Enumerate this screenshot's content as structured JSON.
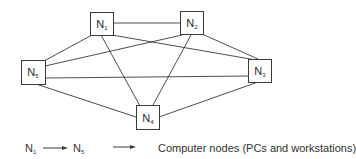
{
  "diagram": {
    "type": "network-topology",
    "line_color": "#3a3a3a",
    "box_fill": "#ffffff",
    "nodes": [
      {
        "id": "N1",
        "base": "N",
        "sub": "1",
        "x": 90,
        "y": 12
      },
      {
        "id": "N2",
        "base": "N",
        "sub": "2",
        "x": 180,
        "y": 12
      },
      {
        "id": "N3",
        "base": "N",
        "sub": "3",
        "x": 248,
        "y": 59
      },
      {
        "id": "N4",
        "base": "N",
        "sub": "4",
        "x": 136,
        "y": 105
      },
      {
        "id": "N5",
        "base": "N",
        "sub": "5",
        "x": 21,
        "y": 60
      }
    ],
    "edges": [
      [
        "N1",
        "N2"
      ],
      [
        "N1",
        "N5"
      ],
      [
        "N1",
        "N3"
      ],
      [
        "N1",
        "N4"
      ],
      [
        "N2",
        "N5"
      ],
      [
        "N2",
        "N3"
      ],
      [
        "N2",
        "N4"
      ],
      [
        "N5",
        "N3"
      ],
      [
        "N5",
        "N4"
      ],
      [
        "N3",
        "N4"
      ]
    ]
  },
  "legend": {
    "range_start": {
      "base": "N",
      "sub": "1"
    },
    "range_end": {
      "base": "N",
      "sub": "5"
    },
    "description": "Computer nodes (PCs and workstations)"
  }
}
